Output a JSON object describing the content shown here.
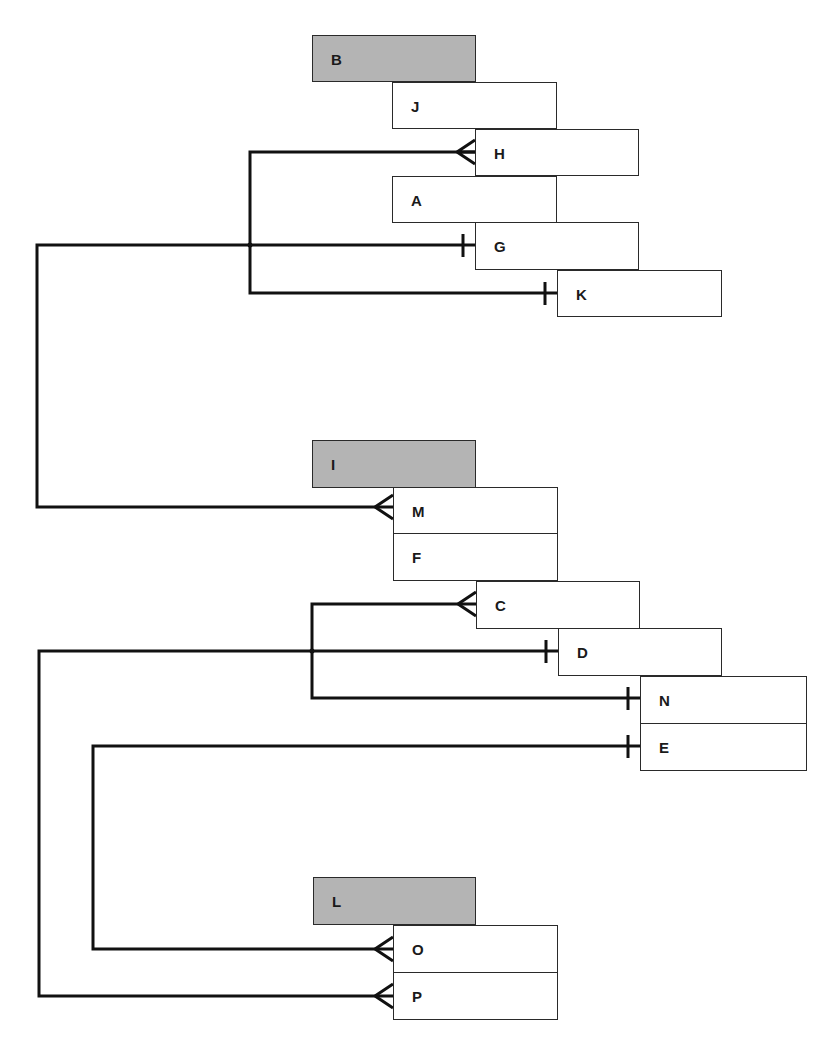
{
  "diagram": {
    "type": "entity-relationship (crow's foot notation)",
    "groups": [
      {
        "header": "B",
        "entities": [
          "J",
          "H",
          "A",
          "G",
          "K"
        ]
      },
      {
        "header": "I",
        "entities": [
          "M",
          "F",
          "C",
          "D",
          "N",
          "E"
        ]
      },
      {
        "header": "L",
        "entities": [
          "O",
          "P"
        ]
      }
    ],
    "boxes": [
      {
        "id": "B",
        "label": "B",
        "kind": "header",
        "x": 312,
        "y": 35,
        "w": 164,
        "h": 47
      },
      {
        "id": "J",
        "label": "J",
        "kind": "entity",
        "x": 392,
        "y": 82,
        "w": 165,
        "h": 47
      },
      {
        "id": "H",
        "label": "H",
        "kind": "entity",
        "x": 475,
        "y": 129,
        "w": 164,
        "h": 47
      },
      {
        "id": "A",
        "label": "A",
        "kind": "entity",
        "x": 392,
        "y": 176,
        "w": 165,
        "h": 47
      },
      {
        "id": "G",
        "label": "G",
        "kind": "entity",
        "x": 475,
        "y": 222,
        "w": 164,
        "h": 48
      },
      {
        "id": "K",
        "label": "K",
        "kind": "entity",
        "x": 557,
        "y": 270,
        "w": 165,
        "h": 47
      },
      {
        "id": "I",
        "label": "I",
        "kind": "header",
        "x": 312,
        "y": 440,
        "w": 164,
        "h": 48
      },
      {
        "id": "M",
        "label": "M",
        "kind": "entity",
        "x": 393,
        "y": 487,
        "w": 165,
        "h": 47
      },
      {
        "id": "F",
        "label": "F",
        "kind": "entity",
        "x": 393,
        "y": 533,
        "w": 165,
        "h": 48
      },
      {
        "id": "C",
        "label": "C",
        "kind": "entity",
        "x": 476,
        "y": 581,
        "w": 164,
        "h": 48
      },
      {
        "id": "D",
        "label": "D",
        "kind": "entity",
        "x": 558,
        "y": 628,
        "w": 164,
        "h": 48
      },
      {
        "id": "N",
        "label": "N",
        "kind": "entity",
        "x": 640,
        "y": 676,
        "w": 167,
        "h": 48
      },
      {
        "id": "E",
        "label": "E",
        "kind": "entity",
        "x": 640,
        "y": 723,
        "w": 167,
        "h": 48
      },
      {
        "id": "L",
        "label": "L",
        "kind": "header",
        "x": 313,
        "y": 877,
        "w": 163,
        "h": 48
      },
      {
        "id": "O",
        "label": "O",
        "kind": "entity",
        "x": 393,
        "y": 925,
        "w": 165,
        "h": 48
      },
      {
        "id": "P",
        "label": "P",
        "kind": "entity",
        "x": 393,
        "y": 972,
        "w": 165,
        "h": 48
      }
    ],
    "relationships": [
      {
        "from": "G",
        "from_end": "one",
        "to": "M",
        "to_end": "many"
      },
      {
        "from": "K",
        "from_end": "one",
        "to": "H",
        "to_end": "many"
      },
      {
        "from": "D",
        "from_end": "one",
        "to": "P",
        "to_end": "many"
      },
      {
        "from": "N",
        "from_end": "one",
        "to": "C",
        "to_end": "many"
      },
      {
        "from": "E",
        "from_end": "one",
        "to": "O",
        "to_end": "many"
      }
    ],
    "colors": {
      "line": "#111111",
      "header_fill": "#b4b4b4",
      "entity_fill": "#ffffff",
      "border": "#2a2a2a"
    }
  }
}
